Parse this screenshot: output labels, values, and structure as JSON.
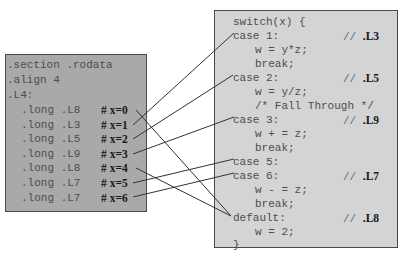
{
  "jump_table": {
    "lines": [
      ".section .rodata",
      ".align 4",
      ".L4:"
    ],
    "entries": [
      {
        "directive": ".long",
        "label": ".L8",
        "comment": "# ",
        "x": "x=0"
      },
      {
        "directive": ".long",
        "label": ".L3",
        "comment": "# ",
        "x": "x=1"
      },
      {
        "directive": ".long",
        "label": ".L5",
        "comment": "# ",
        "x": "x=2"
      },
      {
        "directive": ".long",
        "label": ".L9",
        "comment": "# ",
        "x": "x=3"
      },
      {
        "directive": ".long",
        "label": ".L8",
        "comment": "# ",
        "x": "x=4"
      },
      {
        "directive": ".long",
        "label": ".L7",
        "comment": "# ",
        "x": "x=5"
      },
      {
        "directive": ".long",
        "label": ".L7",
        "comment": "# ",
        "x": "x=6"
      }
    ]
  },
  "switch_code": {
    "lines": [
      {
        "text": "switch(x) {",
        "indent": 0
      },
      {
        "text": "case 1:",
        "indent": 0,
        "comment": "// ",
        "label": ".L3"
      },
      {
        "text": "w = y*z;",
        "indent": 2
      },
      {
        "text": "break;",
        "indent": 2
      },
      {
        "text": "case 2:",
        "indent": 0,
        "comment": "// ",
        "label": ".L5"
      },
      {
        "text": "w = y/z;",
        "indent": 2
      },
      {
        "text": "/* Fall Through */",
        "indent": 2
      },
      {
        "text": "case 3:",
        "indent": 0,
        "comment": "// ",
        "label": ".L9"
      },
      {
        "text": "w + = z;",
        "indent": 2
      },
      {
        "text": "break;",
        "indent": 2
      },
      {
        "text": "case 5:",
        "indent": 0
      },
      {
        "text": "case 6:",
        "indent": 0,
        "comment": "// ",
        "label": ".L7"
      },
      {
        "text": "w - = z;",
        "indent": 2
      },
      {
        "text": "break;",
        "indent": 2
      },
      {
        "text": "default:",
        "indent": 0,
        "comment": "// ",
        "label": ".L8"
      },
      {
        "text": "w = 2;",
        "indent": 2
      },
      {
        "text": "}",
        "indent": 0
      }
    ]
  },
  "connections": [
    {
      "from": "x=0",
      "to": "default:"
    },
    {
      "from": "x=1",
      "to": "case 1:"
    },
    {
      "from": "x=2",
      "to": "case 2:"
    },
    {
      "from": "x=3",
      "to": "case 3:"
    },
    {
      "from": "x=4",
      "to": "default:"
    },
    {
      "from": "x=5",
      "to": "case 5:"
    },
    {
      "from": "x=6",
      "to": "case 6:"
    }
  ],
  "colors": {
    "left_panel": "#a9a9a9",
    "right_panel": "#d4d4d4",
    "border": "#4a4a4a",
    "wire": "#333333"
  }
}
